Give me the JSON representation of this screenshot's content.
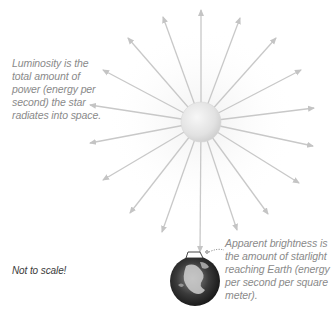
{
  "captions": {
    "luminosity": "Luminosity is the total amount of power (energy per second) the star radiates into space.",
    "apparent_brightness": "Apparent brightness is the amount of starlight reaching Earth (energy per second per square meter).",
    "scale_note": "Not to scale!"
  },
  "colors": {
    "arrow": "#c8c8c8",
    "star_fill": "#e6e6e6",
    "text": "#8a8a8a",
    "note_text": "#3a3a3a",
    "earth_dark": "#1e1e1e"
  },
  "star": {
    "cx": 201,
    "cy": 122,
    "r": 20
  },
  "earth": {
    "cx": 195,
    "cy": 281,
    "r": 25
  },
  "arrows": [
    [
      201,
      10
    ],
    [
      240,
      18
    ],
    [
      276,
      38
    ],
    [
      301,
      70
    ],
    [
      314,
      108
    ],
    [
      313,
      146
    ],
    [
      299,
      183
    ],
    [
      268,
      214
    ],
    [
      237,
      230
    ],
    [
      200,
      252
    ],
    [
      162,
      232
    ],
    [
      130,
      213
    ],
    [
      103,
      180
    ],
    [
      90,
      143
    ],
    [
      90,
      105
    ],
    [
      103,
      70
    ],
    [
      128,
      38
    ],
    [
      163,
      17
    ]
  ]
}
